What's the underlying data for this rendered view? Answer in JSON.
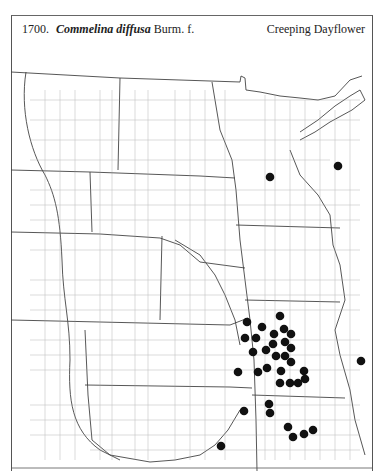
{
  "header": {
    "number": "1700.",
    "scientific_name": "Commelina diffusa",
    "authority": "Burm. f.",
    "common_name": "Creeping Dayflower"
  },
  "map": {
    "description": "County-level distribution map of the Great Plains and upper Midwest",
    "dot_color": "#111111",
    "line_color": "#888888",
    "occurrences": [
      [
        270,
        177
      ],
      [
        338,
        166
      ],
      [
        280,
        316
      ],
      [
        247,
        322
      ],
      [
        262,
        327
      ],
      [
        284,
        329
      ],
      [
        274,
        334
      ],
      [
        291,
        334
      ],
      [
        245,
        338
      ],
      [
        256,
        338
      ],
      [
        273,
        344
      ],
      [
        285,
        342
      ],
      [
        291,
        348
      ],
      [
        253,
        352
      ],
      [
        266,
        350
      ],
      [
        276,
        356
      ],
      [
        285,
        356
      ],
      [
        291,
        362
      ],
      [
        238,
        372
      ],
      [
        258,
        372
      ],
      [
        267,
        368
      ],
      [
        281,
        371
      ],
      [
        304,
        371
      ],
      [
        280,
        383
      ],
      [
        290,
        383
      ],
      [
        298,
        383
      ],
      [
        305,
        379
      ],
      [
        361,
        361
      ],
      [
        269,
        404
      ],
      [
        270,
        413
      ],
      [
        244,
        411
      ],
      [
        288,
        427
      ],
      [
        293,
        437
      ],
      [
        304,
        434
      ],
      [
        313,
        430
      ],
      [
        221,
        446
      ]
    ]
  }
}
